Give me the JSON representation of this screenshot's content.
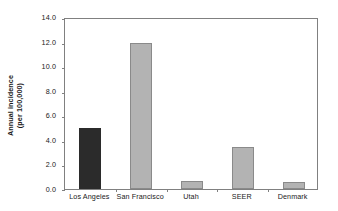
{
  "chart_data": {
    "type": "bar",
    "title": "",
    "subtitle": "",
    "xlabel": "",
    "ylabel": "Annual incidence\n(per 100,000)",
    "ylabel_line1": "Annual incidence",
    "ylabel_line2": "(per 100,000)",
    "categories": [
      "Los Angeles",
      "San Francisco",
      "Utah",
      "SEER",
      "Denmark"
    ],
    "values": [
      5.0,
      11.9,
      0.65,
      3.4,
      0.6
    ],
    "ylim": [
      0.0,
      14.0
    ],
    "ytick_values": [
      0.0,
      2.0,
      4.0,
      6.0,
      8.0,
      10.0,
      12.0,
      14.0
    ],
    "ytick_labels": [
      "0.0",
      "2.0",
      "4.0",
      "6.0",
      "8.0",
      "10.0",
      "12.0",
      "14.0"
    ],
    "grid": false,
    "legend": false,
    "legend_position": "none",
    "bar_colors": [
      "#2b2b2b",
      "#b3b3b3",
      "#b3b3b3",
      "#b3b3b3",
      "#b3b3b3"
    ],
    "bar_edge_color": "#8a8a8a",
    "axis_color": "#808080",
    "text_color": "#1a1a1a",
    "background_color": "#ffffff",
    "highlight_category": "Los Angeles"
  }
}
